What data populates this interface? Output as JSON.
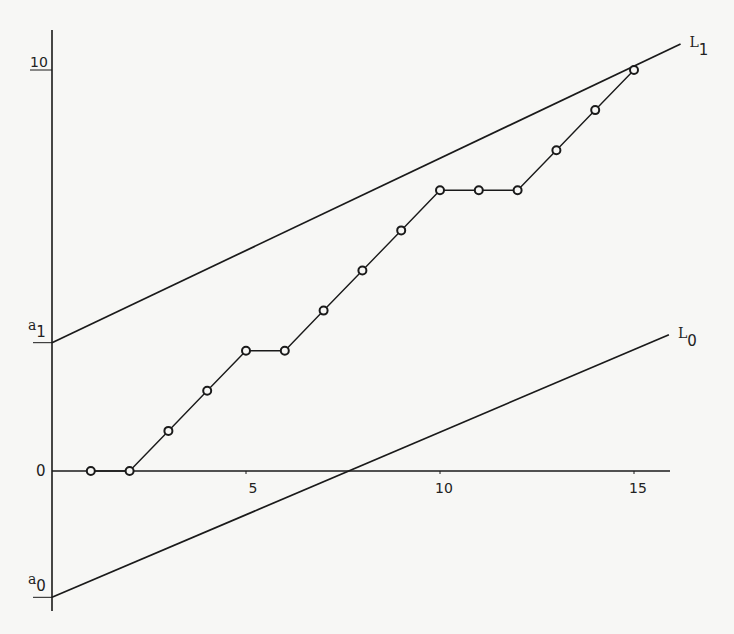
{
  "chart_data": {
    "type": "line",
    "title": "",
    "xlabel": "",
    "ylabel": "",
    "xlim": [
      0,
      16
    ],
    "ylim": [
      -3.5,
      11
    ],
    "grid": false,
    "x_ticks": [
      {
        "value": 5,
        "label": "5"
      },
      {
        "value": 10,
        "label": "10"
      },
      {
        "value": 15,
        "label": "15"
      }
    ],
    "y_ticks": [
      {
        "value": 0,
        "label": "0"
      },
      {
        "value": 10,
        "label": "10"
      }
    ],
    "series": [
      {
        "name": "step path",
        "marker": "open-circle",
        "x": [
          1,
          2,
          3,
          4,
          5,
          6,
          7,
          8,
          9,
          10,
          11,
          12,
          13,
          14,
          15
        ],
        "values": [
          0,
          0,
          1,
          2,
          3,
          3,
          4,
          5,
          6,
          7,
          7,
          7,
          8,
          9,
          10
        ]
      }
    ],
    "lines": [
      {
        "name": "L1",
        "label": "L",
        "subscript": "1",
        "intercept_label": "a",
        "intercept_subscript": "1",
        "intercept": 3.2,
        "x_end": 16.2,
        "y_end": 10.65
      },
      {
        "name": "L0",
        "label": "L",
        "subscript": "0",
        "intercept_label": "a",
        "intercept_subscript": "0",
        "intercept": -3.15,
        "x_end": 15.9,
        "y_end": 3.4
      }
    ],
    "annotations": [
      "a1",
      "a0",
      "L1",
      "L0"
    ]
  }
}
